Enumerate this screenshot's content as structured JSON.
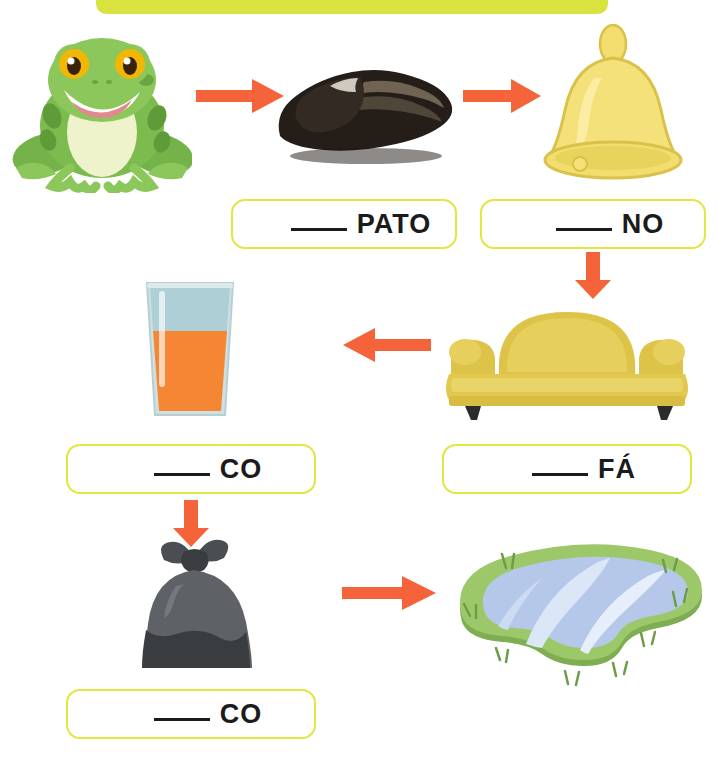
{
  "worksheet": {
    "banner": {
      "name": "title-banner",
      "color": "#d9e340",
      "text": ""
    },
    "background": "#ffffff",
    "accent_arrow_color": "#f4633a",
    "box_border_color": "#e2e63f"
  },
  "pictures": [
    {
      "id": "frog",
      "icon": "frog-image",
      "label": "sapo",
      "colors": {
        "body": "#7ab84a",
        "belly": "#eef3cc",
        "eye": "#f2b705"
      }
    },
    {
      "id": "shoe",
      "icon": "shoe-image",
      "label": "sapato",
      "colors": {
        "body": "#2b2420",
        "inner": "#6f6354"
      }
    },
    {
      "id": "bell",
      "icon": "bell-image",
      "label": "sino",
      "colors": {
        "body": "#f2dd6e",
        "shade": "#e3c84a"
      }
    },
    {
      "id": "juice",
      "icon": "juice-glass-image",
      "label": "suco",
      "colors": {
        "glass": "#b8d4d8",
        "liquid": "#f58634"
      }
    },
    {
      "id": "sofa",
      "icon": "sofa-image",
      "label": "sofá",
      "colors": {
        "body": "#e2c84e",
        "legs": "#2b2b2b"
      }
    },
    {
      "id": "trashbag",
      "icon": "trash-bag-image",
      "label": "saco",
      "colors": {
        "body": "#5e6266",
        "shade": "#3a3d40"
      }
    },
    {
      "id": "lake",
      "icon": "lake-image",
      "label": "lago",
      "colors": {
        "grass": "#9dc86a",
        "water": "#aec3e8"
      }
    }
  ],
  "answers": [
    {
      "id": "answer-pato",
      "blank": "____",
      "suffix": "PATO",
      "full_text": "____ PATO"
    },
    {
      "id": "answer-no",
      "blank": "____",
      "suffix": "NO",
      "full_text": "____ NO"
    },
    {
      "id": "answer-co-1",
      "blank": "____",
      "suffix": "CO",
      "full_text": "____ CO"
    },
    {
      "id": "answer-fa",
      "blank": "____",
      "suffix": "FÁ",
      "full_text": "____ FÁ"
    },
    {
      "id": "answer-co-2",
      "blank": "____",
      "suffix": "CO",
      "full_text": "____ CO"
    }
  ],
  "arrows": [
    {
      "id": "arrow-frog-to-shoe",
      "direction": "right"
    },
    {
      "id": "arrow-shoe-to-bell",
      "direction": "right"
    },
    {
      "id": "arrow-bell-to-sofa",
      "direction": "down"
    },
    {
      "id": "arrow-sofa-to-juice",
      "direction": "left"
    },
    {
      "id": "arrow-juice-to-bag",
      "direction": "down"
    },
    {
      "id": "arrow-bag-to-lake",
      "direction": "right"
    }
  ]
}
